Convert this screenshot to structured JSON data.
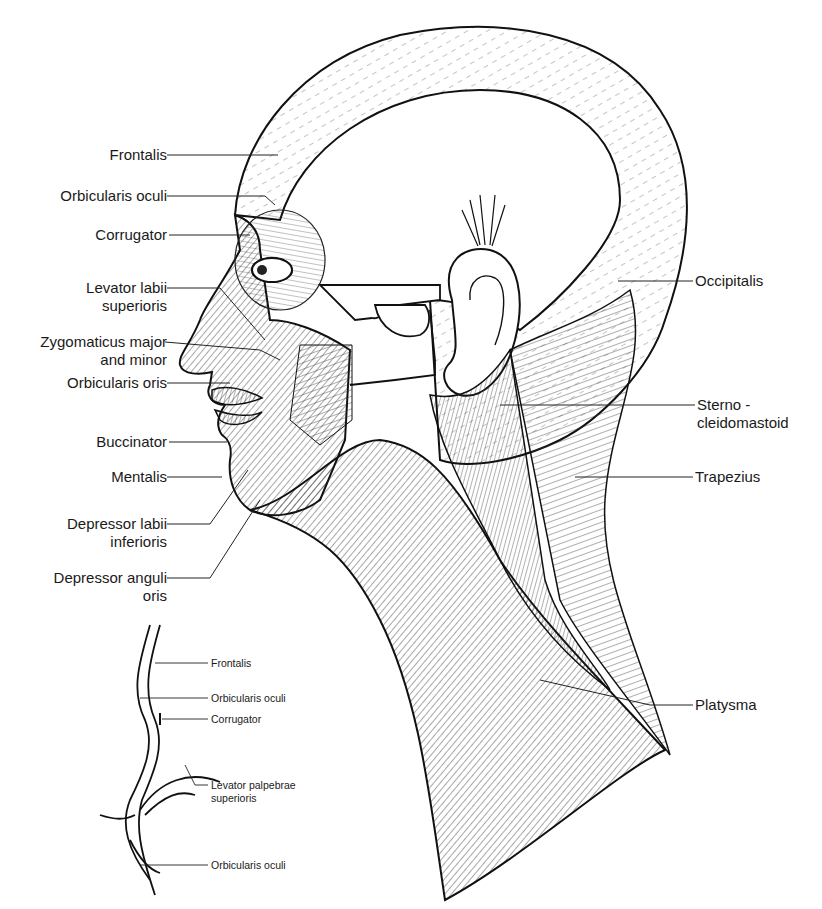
{
  "figure": {
    "main_labels_left": [
      {
        "id": "frontalis",
        "lines": [
          "Frontalis"
        ]
      },
      {
        "id": "orbicularis-oculi",
        "lines": [
          "Orbicularis oculi"
        ]
      },
      {
        "id": "corrugator",
        "lines": [
          "Corrugator"
        ]
      },
      {
        "id": "levator-labii-superioris",
        "lines": [
          "Levator labii",
          "superioris"
        ]
      },
      {
        "id": "zygomaticus",
        "lines": [
          "Zygomaticus major",
          "and minor"
        ]
      },
      {
        "id": "orbicularis-oris",
        "lines": [
          "Orbicularis oris"
        ]
      },
      {
        "id": "buccinator",
        "lines": [
          "Buccinator"
        ]
      },
      {
        "id": "mentalis",
        "lines": [
          "Mentalis"
        ]
      },
      {
        "id": "depressor-labii-inferioris",
        "lines": [
          "Depressor labii",
          "inferioris"
        ]
      },
      {
        "id": "depressor-anguli-oris",
        "lines": [
          "Depressor anguli",
          "oris"
        ]
      }
    ],
    "main_labels_right": [
      {
        "id": "occipitalis",
        "lines": [
          "Occipitalis"
        ]
      },
      {
        "id": "sternocleidomastoid",
        "lines": [
          "Sterno -",
          "cleidomastoid"
        ]
      },
      {
        "id": "trapezius",
        "lines": [
          "Trapezius"
        ]
      },
      {
        "id": "platysma",
        "lines": [
          "Platysma"
        ]
      }
    ],
    "inset_labels": [
      {
        "id": "inset-frontalis",
        "lines": [
          "Frontalis"
        ]
      },
      {
        "id": "inset-orbicularis-oculi-upper",
        "lines": [
          "Orbicularis oculi"
        ]
      },
      {
        "id": "inset-corrugator",
        "lines": [
          "Corrugator"
        ]
      },
      {
        "id": "inset-levator-palpebrae",
        "lines": [
          "Levator palpebrae",
          "superioris"
        ]
      },
      {
        "id": "inset-orbicularis-oculi-lower",
        "lines": [
          "Orbicularis oculi"
        ]
      }
    ]
  }
}
